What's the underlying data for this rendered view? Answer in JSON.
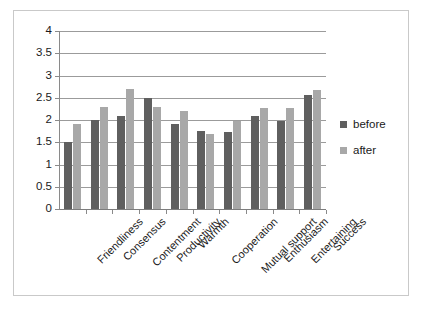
{
  "chart_data": {
    "type": "bar",
    "title": "",
    "xlabel": "",
    "ylabel": "",
    "ylim": [
      0,
      4
    ],
    "yticks": [
      "0",
      "0.5",
      "1",
      "1.5",
      "2",
      "2.5",
      "3",
      "3.5",
      "4"
    ],
    "ytick_values": [
      0,
      0.5,
      1,
      1.5,
      2,
      2.5,
      3,
      3.5,
      4
    ],
    "grid": true,
    "legend_position": "right",
    "categories": [
      "Friendliness",
      "Consensus",
      "Contentment",
      "Productivity",
      "Warmth",
      "Cooperation",
      "Mutual support",
      "Enthusiasm",
      "Entertaining",
      "Success"
    ],
    "series": [
      {
        "name": "before",
        "color": "#5f5f5f",
        "values": [
          1.5,
          2.0,
          2.1,
          2.5,
          1.9,
          1.75,
          1.72,
          2.08,
          1.98,
          2.57
        ]
      },
      {
        "name": "after",
        "color": "#a8a8a8",
        "values": [
          1.9,
          2.3,
          2.7,
          2.3,
          2.2,
          1.68,
          1.98,
          2.28,
          2.28,
          2.68
        ]
      }
    ]
  },
  "legend": {
    "items": [
      {
        "label": "before",
        "color": "#5f5f5f"
      },
      {
        "label": "after",
        "color": "#a8a8a8"
      }
    ]
  },
  "colors": {
    "before": "#5f5f5f",
    "after": "#a8a8a8",
    "gridline": "#9b9b9b",
    "axis": "#8a8a8a",
    "frame": "#c9c9c9",
    "text": "#1a1a1a",
    "background": "#ffffff"
  }
}
